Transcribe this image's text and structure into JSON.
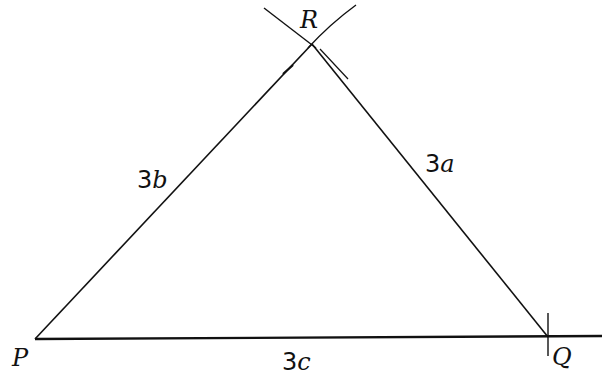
{
  "diagram": {
    "type": "triangle-construction",
    "vertices": [
      {
        "id": "P",
        "label": "P",
        "x": 35,
        "y": 339
      },
      {
        "id": "Q",
        "label": "Q",
        "x": 548,
        "y": 337
      },
      {
        "id": "R",
        "label": "R",
        "x": 312,
        "y": 44
      }
    ],
    "sides": [
      {
        "id": "PR",
        "label_prefix": "3",
        "label_var": "b"
      },
      {
        "id": "RQ",
        "label_prefix": "3",
        "label_var": "a"
      },
      {
        "id": "PQ",
        "label_prefix": "3",
        "label_var": "c"
      }
    ],
    "line_color": "#111111"
  }
}
